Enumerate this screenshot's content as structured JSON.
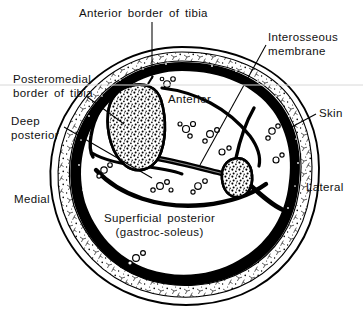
{
  "figure": {
    "width": 363,
    "height": 316,
    "background_color": "#ffffff",
    "ink_color": "#000000"
  },
  "labels": {
    "anterior_border_of_tibia": "Anterior border of tibia",
    "interosseous_membrane_line1": "Interosseous",
    "interosseous_membrane_line2": "membrane",
    "posteromedial_border_line1": "Posteromedial",
    "posteromedial_border_line2": "border of tibia",
    "deep_posterior_line1": "Deep",
    "deep_posterior_line2": "posterior",
    "anterior": "Anterior",
    "skin": "Skin",
    "medial": "Medial",
    "lateral": "Lateral",
    "superficial_posterior_line1": "Superficial posterior",
    "superficial_posterior_line2": "(gastroc-soleus)"
  },
  "compartments": [
    {
      "name": "Anterior",
      "label": "Anterior"
    },
    {
      "name": "Lateral",
      "label": ""
    },
    {
      "name": "Deep posterior",
      "label": "Deep posterior"
    },
    {
      "name": "Superficial posterior",
      "label": "Superficial posterior (gastroc-soleus)"
    }
  ],
  "structures": [
    {
      "name": "tibia",
      "description": "teardrop shaped bone with trabecular stipple"
    },
    {
      "name": "fibula",
      "description": "small oval bone with trabecular stipple"
    },
    {
      "name": "interosseous-membrane",
      "description": "thin band between tibia and fibula"
    },
    {
      "name": "skin",
      "description": "outer boundary line"
    },
    {
      "name": "subcutaneous-fat",
      "description": "stippled layer beneath skin"
    },
    {
      "name": "deep-fascia",
      "description": "heavy black enclosing ring"
    },
    {
      "name": "neurovascular-bundles",
      "description": "small clustered circles within compartments"
    }
  ]
}
